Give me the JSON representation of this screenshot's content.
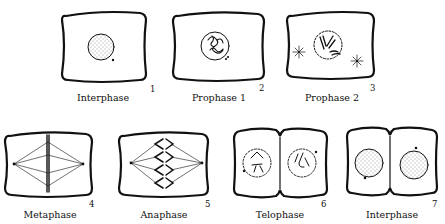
{
  "diagram": {
    "stages": [
      {
        "number": "1",
        "label": "Interphase"
      },
      {
        "number": "2",
        "label": "Prophase 1"
      },
      {
        "number": "3",
        "label": "Prophase 2"
      },
      {
        "number": "4",
        "label": "Metaphase"
      },
      {
        "number": "5",
        "label": "Anaphase"
      },
      {
        "number": "6",
        "label": "Telophase"
      },
      {
        "number": "7",
        "label": "Interphase"
      }
    ]
  }
}
